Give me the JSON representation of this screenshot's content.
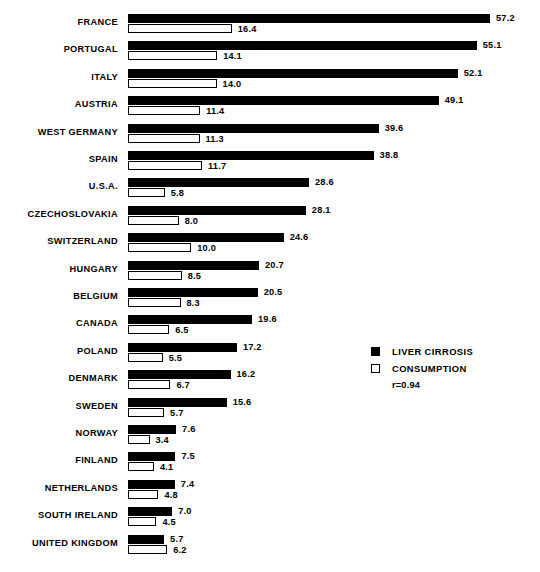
{
  "chart_data": {
    "type": "bar",
    "orientation": "horizontal",
    "title": "",
    "xlabel": "",
    "ylabel": "",
    "grid": false,
    "xlim": [
      0,
      57.2
    ],
    "categories": [
      "FRANCE",
      "PORTUGAL",
      "ITALY",
      "AUSTRIA",
      "WEST GERMANY",
      "SPAIN",
      "U.S.A.",
      "CZECHOSLOVAKIA",
      "SWITZERLAND",
      "HUNGARY",
      "BELGIUM",
      "CANADA",
      "POLAND",
      "DENMARK",
      "SWEDEN",
      "NORWAY",
      "FINLAND",
      "NETHERLANDS",
      "SOUTH IRELAND",
      "UNITED KINGDOM"
    ],
    "series": [
      {
        "name": "LIVER CIRROSIS",
        "style": "filled",
        "color": "#000000",
        "values": [
          57.2,
          55.1,
          52.1,
          49.1,
          39.6,
          38.8,
          28.6,
          28.1,
          24.6,
          20.7,
          20.5,
          19.6,
          17.2,
          16.2,
          15.6,
          7.6,
          7.5,
          7.4,
          7.0,
          5.7
        ],
        "labels": [
          "57.2",
          "55.1",
          "52.1",
          "49.1",
          "39.6",
          "38.8",
          "28.6",
          "28.1",
          "24.6",
          "20.7",
          "20.5",
          "19.6",
          "17.2",
          "16.2",
          "15.6",
          "7.6",
          "7.5",
          "7.4",
          "7.0",
          "5.7"
        ]
      },
      {
        "name": "CONSUMPTION",
        "style": "open",
        "color": "#ffffff",
        "values": [
          16.4,
          14.1,
          14.0,
          11.4,
          11.3,
          11.7,
          5.8,
          8.0,
          10.0,
          8.5,
          8.3,
          6.5,
          5.5,
          6.7,
          5.7,
          3.4,
          4.1,
          4.8,
          4.5,
          6.2
        ],
        "labels": [
          "16.4",
          "14.1",
          "14.0",
          "11.4",
          "11.3",
          "11.7",
          "5.8",
          "8.0",
          "10.0",
          "8.5",
          "8.3",
          "6.5",
          "5.5",
          "6.7",
          "5.7",
          "3.4",
          "4.1",
          "4.8",
          "4.5",
          "6.2"
        ]
      }
    ],
    "annotations": [
      {
        "name": "correlation",
        "text": "r=0.94"
      }
    ]
  },
  "legend": {
    "position": "right-middle",
    "entries": [
      {
        "label": "LIVER CIRROSIS",
        "swatch": "filled-square"
      },
      {
        "label": "CONSUMPTION",
        "swatch": "open-square"
      }
    ],
    "correlation": "r=0.94"
  },
  "layout": {
    "bar_origin_x": 128,
    "px_per_unit": 6.33,
    "row_pitch": 27.4,
    "first_row_top": 14,
    "bar_height": 9
  }
}
